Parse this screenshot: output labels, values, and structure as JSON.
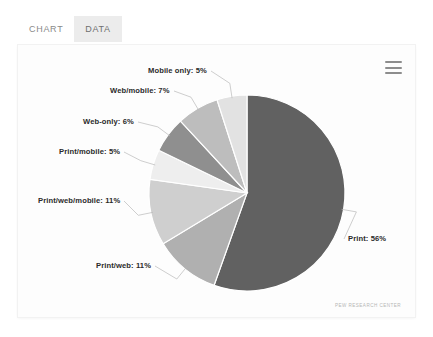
{
  "tabs": [
    {
      "label": "CHART",
      "active": false
    },
    {
      "label": "DATA",
      "active": true
    }
  ],
  "menu": {
    "icon": "hamburger-menu-icon",
    "label": "Chart context menu"
  },
  "footer": {
    "credit": "PEW RESEARCH CENTER"
  },
  "chart_data": {
    "type": "pie",
    "title": "",
    "subtitle": "",
    "xlabel": "",
    "ylabel": "",
    "legend_position": "none",
    "grid": false,
    "start_angle_deg": -90,
    "direction": "clockwise",
    "categories": [
      "Print",
      "Print/web",
      "Print/web/mobile",
      "Print/mobile",
      "Web-only",
      "Web/mobile",
      "Mobile only"
    ],
    "values": [
      56,
      11,
      11,
      5,
      6,
      7,
      5
    ],
    "value_suffix": "%",
    "labels": [
      "Print: 56%",
      "Print/web: 11%",
      "Print/web/mobile: 11%",
      "Print/mobile: 5%",
      "Web-only: 6%",
      "Web/mobile: 7%",
      "Mobile only: 5%"
    ],
    "colors": [
      "#616161",
      "#b0b0b0",
      "#cfcfcf",
      "#eeeeee",
      "#8f8f8f",
      "#bdbdbd",
      "#e2e2e2"
    ],
    "slice_border_color": "#ffffff"
  },
  "labels_layout": [
    {
      "name": "label-print",
      "text": "Print: 56%",
      "left": 330,
      "top": 189
    },
    {
      "name": "label-print-web",
      "text": "Print/web: 11%",
      "left": 78,
      "top": 216
    },
    {
      "name": "label-print-web-mobile",
      "text": "Print/web/mobile: 11%",
      "left": 20,
      "top": 151
    },
    {
      "name": "label-print-mobile",
      "text": "Print/mobile: 5%",
      "left": 41,
      "top": 102
    },
    {
      "name": "label-web-only",
      "text": "Web-only: 6%",
      "left": 65,
      "top": 72
    },
    {
      "name": "label-web-mobile",
      "text": "Web/mobile: 7%",
      "left": 92,
      "top": 41
    },
    {
      "name": "label-mobile-only",
      "text": "Mobile only: 5%",
      "left": 130,
      "top": 21
    }
  ]
}
